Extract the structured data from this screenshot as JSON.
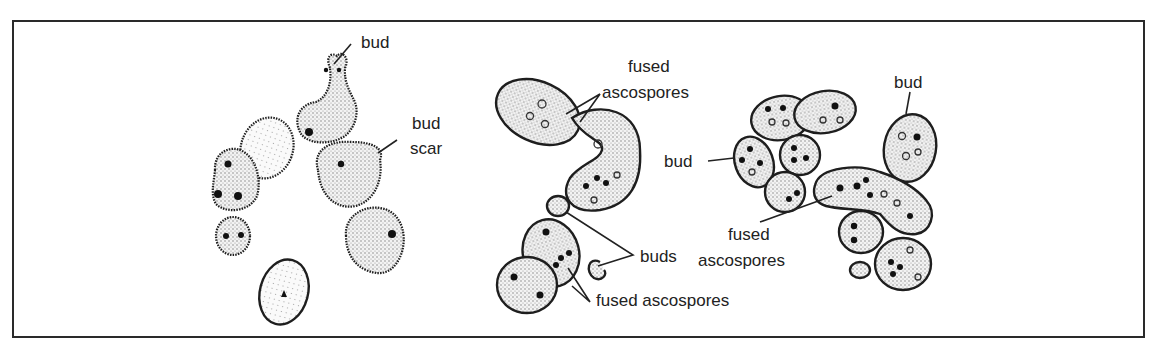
{
  "figure": {
    "type": "biological illustration",
    "panels": [
      {
        "id": "left",
        "labels": [
          {
            "text": "bud",
            "lines": [
              "bud"
            ]
          },
          {
            "text": "bud scar",
            "lines": [
              "bud",
              "scar"
            ]
          }
        ]
      },
      {
        "id": "middle",
        "labels": [
          {
            "text": "fused ascospores",
            "lines": [
              "fused",
              "ascospores"
            ]
          },
          {
            "text": "buds",
            "lines": [
              "buds"
            ]
          },
          {
            "text": "fused ascospores",
            "lines": [
              "fused ascospores"
            ]
          }
        ]
      },
      {
        "id": "right",
        "labels": [
          {
            "text": "bud",
            "lines": [
              "bud"
            ]
          },
          {
            "text": "bud",
            "lines": [
              "bud"
            ]
          },
          {
            "text": "fused ascospores",
            "lines": [
              "fused",
              "ascospores"
            ]
          }
        ]
      }
    ]
  },
  "colors": {
    "stroke": "#1e1e1e",
    "fill": "#e6e6e6",
    "background": "#ffffff"
  }
}
